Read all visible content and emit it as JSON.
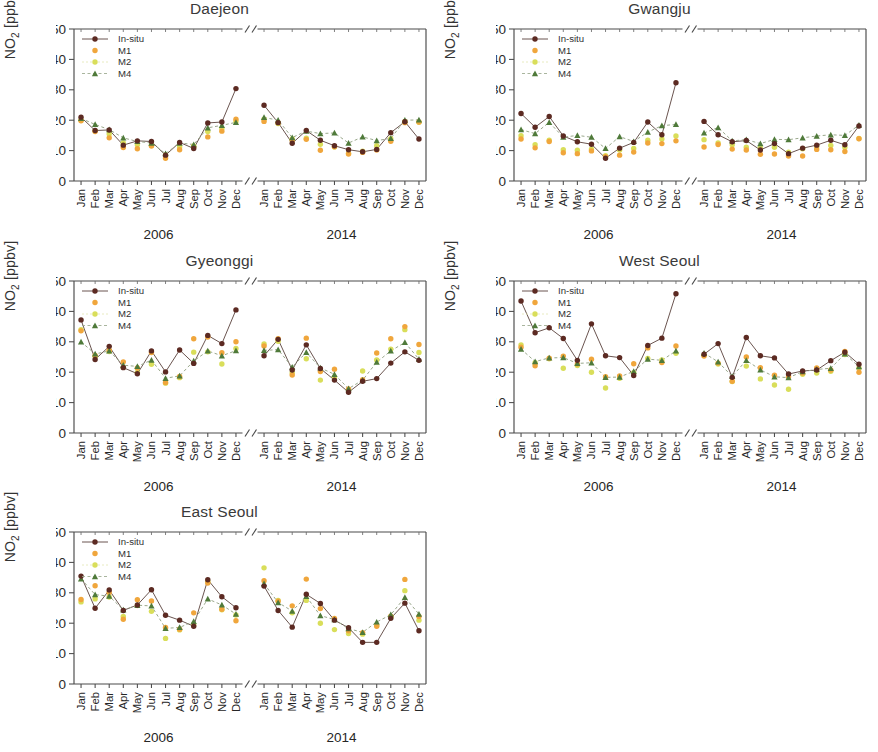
{
  "figure": {
    "ylabel_main": "NO",
    "ylabel_sub": "2",
    "ylabel_unit": " [ppbv]",
    "ylabel_full": "NO2 [ppbv]",
    "year_left": "2006",
    "year_right": "2014",
    "months": [
      "Jan",
      "Feb",
      "Mar",
      "Apr",
      "May",
      "Jun",
      "Jul",
      "Aug",
      "Sep",
      "Oct",
      "Nov",
      "Dec"
    ],
    "ytick_labels": [
      "0",
      "10",
      "20",
      "30",
      "40",
      "50"
    ],
    "legend_labels": [
      "In-situ",
      "M1",
      "M2",
      "M4"
    ],
    "colors": {
      "insitu": "#5c2a22",
      "m1": "#f0a63c",
      "m2": "#d9de5a",
      "m4": "#4f7a3a",
      "axis": "#4a4a4a",
      "line": "#6b5550",
      "background": "#ffffff"
    },
    "panel_titles": [
      "Daejeon",
      "Gwangju",
      "Gyeonggi",
      "West Seoul",
      "East Seoul"
    ]
  },
  "chart_data": [
    {
      "type": "line",
      "title": "Daejeon",
      "xlabel": "",
      "ylabel": "NO2 [ppbv]",
      "ylim": [
        0,
        50
      ],
      "grid": false,
      "legend_position": "top-left",
      "axis_break": true,
      "categories": [
        "Jan",
        "Feb",
        "Mar",
        "Apr",
        "May",
        "Jun",
        "Jul",
        "Aug",
        "Sep",
        "Oct",
        "Nov",
        "Dec"
      ],
      "panels": [
        {
          "year": "2006",
          "series": [
            {
              "name": "In-situ",
              "values": [
                21.0,
                16.6,
                16.8,
                11.8,
                13.2,
                13.0,
                8.5,
                12.7,
                10.7,
                19.1,
                19.4,
                30.4
              ]
            },
            {
              "name": "M1",
              "values": [
                19.8,
                16.3,
                14.2,
                11.0,
                10.6,
                11.5,
                7.5,
                10.3,
                11.2,
                14.5,
                16.4,
                20.3
              ]
            },
            {
              "name": "M2",
              "values": [
                20.0,
                16.5,
                15.5,
                12.5,
                11.9,
                11.8,
                8.6,
                11.2,
                11.5,
                16.3,
                17.3,
                19.6
              ]
            },
            {
              "name": "M4",
              "values": [
                20.6,
                18.6,
                16.9,
                14.2,
                13.0,
                12.5,
                9.0,
                12.5,
                12.0,
                17.5,
                18.3,
                19.3
              ]
            }
          ]
        },
        {
          "year": "2014",
          "series": [
            {
              "name": "In-situ",
              "values": [
                24.9,
                19.2,
                12.4,
                16.6,
                13.4,
                11.6,
                10.3,
                9.6,
                10.4,
                15.9,
                19.5,
                13.8
              ]
            },
            {
              "name": "M1",
              "values": [
                19.6,
                19.2,
                13.3,
                13.7,
                10.1,
                11.3,
                8.9,
                9.4,
                10.2,
                13.1,
                19.2,
                19.4
              ]
            },
            {
              "name": "M2",
              "values": [
                20.3,
                18.9,
                13.8,
                14.1,
                12.1,
                11.2,
                9.1,
                9.8,
                11.6,
                13.9,
                19.6,
                19.3
              ]
            },
            {
              "name": "M4",
              "values": [
                20.9,
                20.0,
                14.3,
                16.4,
                15.6,
                15.8,
                12.5,
                14.5,
                13.3,
                14.0,
                20.0,
                20.1
              ]
            }
          ]
        }
      ]
    },
    {
      "type": "line",
      "title": "Gwangju",
      "xlabel": "",
      "ylabel": "NO2 [ppbv]",
      "ylim": [
        0,
        50
      ],
      "grid": false,
      "legend_position": "top-left",
      "axis_break": true,
      "categories": [
        "Jan",
        "Feb",
        "Mar",
        "Apr",
        "May",
        "Jun",
        "Jul",
        "Aug",
        "Sep",
        "Oct",
        "Nov",
        "Dec"
      ],
      "panels": [
        {
          "year": "2006",
          "series": [
            {
              "name": "In-situ",
              "values": [
                22.2,
                17.7,
                21.2,
                14.8,
                12.9,
                12.1,
                7.5,
                10.8,
                12.7,
                19.4,
                15.2,
                32.3
              ]
            },
            {
              "name": "M1",
              "values": [
                13.8,
                10.9,
                13.0,
                9.3,
                9.0,
                9.9,
                8.0,
                8.5,
                9.5,
                12.5,
                12.3,
                13.2
              ]
            },
            {
              "name": "M2",
              "values": [
                14.9,
                11.9,
                13.4,
                10.3,
                10.1,
                10.5,
                8.3,
                10.2,
                10.7,
                13.4,
                13.8,
                14.8
              ]
            },
            {
              "name": "M4",
              "values": [
                16.9,
                15.6,
                19.3,
                14.4,
                15.0,
                14.4,
                10.7,
                14.6,
                13.0,
                16.1,
                18.2,
                18.6
              ]
            }
          ]
        },
        {
          "year": "2014",
          "series": [
            {
              "name": "In-situ",
              "values": [
                19.6,
                15.2,
                12.9,
                13.3,
                10.2,
                12.3,
                9.0,
                10.8,
                11.8,
                13.4,
                11.9,
                18.1
              ]
            },
            {
              "name": "M1",
              "values": [
                11.2,
                12.0,
                10.5,
                10.2,
                8.8,
                8.9,
                8.2,
                8.2,
                10.4,
                10.3,
                9.7,
                13.9
              ]
            },
            {
              "name": "M2",
              "values": [
                13.6,
                12.5,
                11.9,
                11.1,
                10.9,
                11.1,
                9.5,
                10.6,
                11.3,
                11.7,
                11.1,
                14.0
              ]
            },
            {
              "name": "M4",
              "values": [
                15.8,
                17.6,
                13.2,
                13.6,
                12.3,
                13.7,
                13.6,
                14.2,
                14.8,
                15.2,
                15.0,
                18.4
              ]
            }
          ]
        }
      ]
    },
    {
      "type": "line",
      "title": "Gyeonggi",
      "xlabel": "",
      "ylabel": "NO2 [ppbv]",
      "ylim": [
        0,
        50
      ],
      "grid": false,
      "legend_position": "top-left",
      "axis_break": true,
      "categories": [
        "Jan",
        "Feb",
        "Mar",
        "Apr",
        "May",
        "Jun",
        "Jul",
        "Aug",
        "Sep",
        "Oct",
        "Nov",
        "Dec"
      ],
      "panels": [
        {
          "year": "2006",
          "series": [
            {
              "name": "In-situ",
              "values": [
                37.2,
                24.2,
                28.5,
                21.5,
                19.5,
                27.0,
                20.1,
                27.3,
                22.9,
                32.1,
                29.4,
                40.5
              ]
            },
            {
              "name": "M1",
              "values": [
                33.6,
                25.5,
                27.2,
                23.4,
                21.4,
                26.5,
                16.6,
                18.6,
                31.0,
                31.6,
                26.4,
                30.0
              ]
            },
            {
              "name": "M2",
              "values": [
                34.0,
                25.2,
                26.8,
                21.6,
                19.9,
                22.6,
                16.4,
                18.2,
                26.6,
                26.7,
                22.7,
                27.8
              ]
            },
            {
              "name": "M4",
              "values": [
                30.0,
                26.0,
                27.0,
                22.3,
                21.9,
                24.0,
                18.0,
                18.8,
                23.7,
                27.0,
                25.4,
                27.1
              ]
            }
          ]
        },
        {
          "year": "2014",
          "series": [
            {
              "name": "In-situ",
              "values": [
                25.4,
                30.8,
                20.7,
                29.0,
                21.2,
                17.4,
                13.4,
                17.0,
                17.9,
                23.0,
                26.7,
                23.9
              ]
            },
            {
              "name": "M1",
              "values": [
                28.6,
                31.0,
                19.1,
                31.2,
                20.2,
                21.0,
                14.5,
                17.5,
                26.3,
                31.0,
                35.0,
                29.1
              ]
            },
            {
              "name": "M2",
              "values": [
                29.3,
                30.2,
                19.8,
                24.4,
                17.4,
                18.4,
                14.2,
                20.4,
                24.0,
                27.6,
                34.0,
                26.5
              ]
            },
            {
              "name": "M4",
              "values": [
                27.2,
                27.4,
                21.7,
                26.5,
                21.4,
                19.3,
                14.6,
                17.4,
                23.3,
                27.0,
                29.8,
                24.3
              ]
            }
          ]
        }
      ]
    },
    {
      "type": "line",
      "title": "West Seoul",
      "xlabel": "",
      "ylabel": "NO2 [ppbv]",
      "ylim": [
        0,
        50
      ],
      "grid": false,
      "legend_position": "top-left",
      "axis_break": true,
      "categories": [
        "Jan",
        "Feb",
        "Mar",
        "Apr",
        "May",
        "Jun",
        "Jul",
        "Aug",
        "Sep",
        "Oct",
        "Nov",
        "Dec"
      ],
      "panels": [
        {
          "year": "2006",
          "series": [
            {
              "name": "In-situ",
              "values": [
                43.4,
                33.0,
                34.6,
                31.1,
                23.9,
                35.9,
                25.4,
                24.8,
                18.9,
                28.8,
                31.2,
                45.8
              ]
            },
            {
              "name": "M1",
              "values": [
                28.2,
                22.1,
                24.6,
                25.3,
                22.7,
                24.3,
                18.5,
                18.8,
                22.8,
                28.0,
                23.2,
                28.6
              ]
            },
            {
              "name": "M2",
              "values": [
                29.0,
                23.1,
                24.4,
                21.3,
                22.2,
                20.0,
                14.8,
                18.0,
                19.8,
                24.5,
                24.0,
                26.2
              ]
            },
            {
              "name": "M4",
              "values": [
                27.6,
                23.5,
                24.7,
                24.8,
                22.9,
                23.1,
                18.3,
                18.4,
                20.3,
                24.3,
                23.9,
                27.0
              ]
            }
          ]
        },
        {
          "year": "2014",
          "series": [
            {
              "name": "In-situ",
              "values": [
                25.9,
                29.4,
                18.3,
                31.4,
                25.4,
                24.7,
                19.4,
                20.4,
                20.7,
                23.8,
                26.6,
                22.6
              ]
            },
            {
              "name": "M1",
              "values": [
                25.3,
                23.0,
                17.0,
                25.0,
                21.5,
                19.0,
                18.5,
                19.7,
                21.4,
                20.7,
                26.8,
                20.0
              ]
            },
            {
              "name": "M2",
              "values": [
                25.6,
                22.7,
                16.9,
                22.0,
                17.8,
                15.8,
                14.4,
                19.3,
                19.7,
                20.3,
                25.8,
                21.4
              ]
            },
            {
              "name": "M4",
              "values": [
                26.3,
                23.4,
                18.6,
                23.9,
                20.8,
                18.5,
                18.2,
                20.2,
                20.9,
                21.3,
                26.0,
                21.8
              ]
            }
          ]
        }
      ]
    },
    {
      "type": "line",
      "title": "East Seoul",
      "xlabel": "",
      "ylabel": "NO2 [ppbv]",
      "ylim": [
        0,
        50
      ],
      "grid": false,
      "legend_position": "top-left",
      "axis_break": true,
      "categories": [
        "Jan",
        "Feb",
        "Mar",
        "Apr",
        "May",
        "Jun",
        "Jul",
        "Aug",
        "Sep",
        "Oct",
        "Nov",
        "Dec"
      ],
      "panels": [
        {
          "year": "2006",
          "series": [
            {
              "name": "In-situ",
              "values": [
                35.5,
                24.9,
                30.9,
                24.2,
                26.0,
                31.0,
                22.6,
                21.0,
                19.0,
                34.3,
                28.7,
                25.1
              ]
            },
            {
              "name": "M1",
              "values": [
                27.8,
                32.3,
                30.1,
                21.3,
                27.7,
                27.3,
                18.6,
                18.0,
                23.4,
                33.2,
                24.6,
                20.8
              ]
            },
            {
              "name": "M2",
              "values": [
                27.0,
                28.0,
                28.6,
                22.2,
                25.8,
                23.9,
                15.0,
                17.8,
                19.5,
                33.8,
                24.4,
                22.7
              ]
            },
            {
              "name": "M4",
              "values": [
                34.6,
                29.4,
                28.9,
                24.4,
                25.9,
                25.7,
                18.3,
                18.6,
                20.6,
                28.0,
                26.0,
                23.0
              ]
            }
          ]
        },
        {
          "year": "2014",
          "series": [
            {
              "name": "In-situ",
              "values": [
                32.2,
                24.2,
                18.7,
                29.5,
                26.5,
                21.0,
                18.5,
                13.7,
                13.7,
                21.6,
                26.6,
                17.5
              ]
            },
            {
              "name": "M1",
              "values": [
                34.0,
                27.2,
                25.7,
                34.5,
                24.8,
                21.6,
                17.5,
                16.9,
                19.0,
                22.3,
                34.4,
                22.2
              ]
            },
            {
              "name": "M2",
              "values": [
                38.2,
                27.5,
                23.4,
                27.5,
                20.0,
                17.9,
                16.6,
                16.4,
                19.3,
                22.0,
                30.7,
                21.0
              ]
            },
            {
              "name": "M4",
              "values": [
                33.0,
                26.8,
                24.0,
                28.8,
                22.5,
                21.2,
                18.2,
                17.0,
                20.4,
                22.8,
                28.5,
                23.0
              ]
            }
          ]
        }
      ]
    }
  ]
}
